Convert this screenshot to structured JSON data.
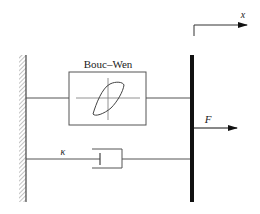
{
  "diagram": {
    "labels": {
      "bouc_wen": "Bouc–Wen",
      "damping": "κ",
      "force": "F",
      "displacement": "x"
    },
    "colors": {
      "line": "#555555",
      "bar": "#111111",
      "text": "#222222",
      "hatch": "#888888"
    }
  }
}
